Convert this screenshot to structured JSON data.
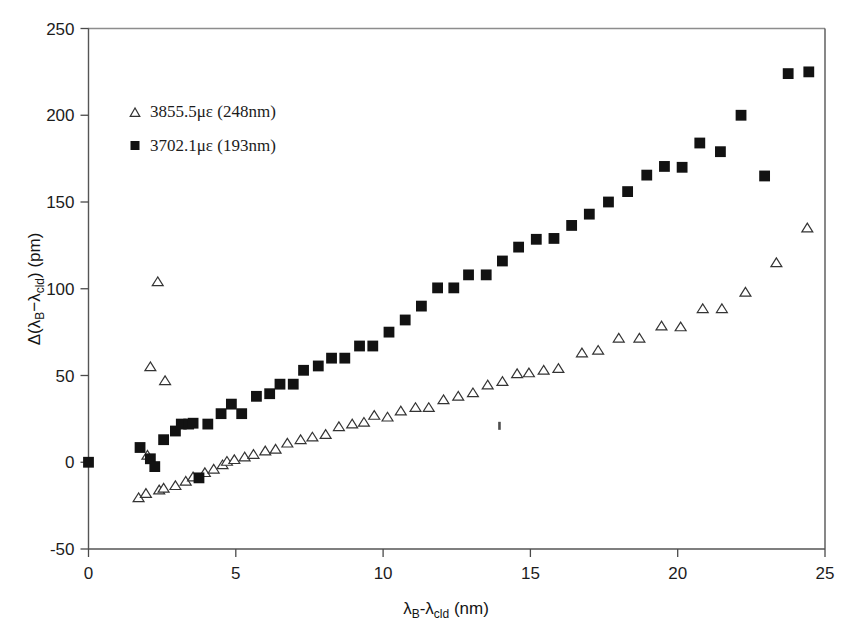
{
  "chart_data": {
    "type": "scatter",
    "title": "",
    "subtitle": "",
    "xlabel": "λB-λcld (nm)",
    "xlabel_parts": {
      "lead": "λ",
      "sub1": "B",
      "mid": "-λ",
      "sub2": "cld",
      "tail": " (nm)"
    },
    "ylabel": "Δ(λB-λcld) (pm)",
    "ylabel_parts": {
      "lead": "Δ(λ",
      "sub1": "B",
      "mid": "−λ",
      "sub2": "cld",
      "tail": ") (pm)"
    },
    "xlim": [
      0,
      25
    ],
    "ylim": [
      -50,
      250
    ],
    "xticks": [
      0,
      5,
      10,
      15,
      20,
      25
    ],
    "yticks": [
      -50,
      0,
      50,
      100,
      150,
      200,
      250
    ],
    "xtick_labels": [
      "0",
      "5",
      "10",
      "15",
      "20",
      "25"
    ],
    "ytick_labels": [
      "-50",
      "0",
      "50",
      "100",
      "150",
      "200",
      "250"
    ],
    "grid": false,
    "legend_position": "upper-left-inside",
    "marker_colors": {
      "series1": "#333333",
      "series2": "#121212"
    },
    "series": [
      {
        "name": "3855.5με (248nm)",
        "label_parts": {
          "value": "3855.5",
          "unit": "με",
          "paren": " (248nm)"
        },
        "marker": "open-triangle",
        "points": [
          [
            1.7,
            -20.5
          ],
          [
            1.95,
            -18.0
          ],
          [
            2.0,
            4.0
          ],
          [
            2.1,
            55.0
          ],
          [
            2.35,
            104.0
          ],
          [
            2.4,
            -16.0
          ],
          [
            2.55,
            -15.0
          ],
          [
            2.6,
            47.0
          ],
          [
            2.95,
            -13.5
          ],
          [
            3.3,
            -11.0
          ],
          [
            3.55,
            -8.5
          ],
          [
            3.95,
            -6.0
          ],
          [
            4.25,
            -4.0
          ],
          [
            4.55,
            -1.5
          ],
          [
            4.7,
            0.5
          ],
          [
            4.95,
            1.5
          ],
          [
            5.3,
            3.0
          ],
          [
            5.6,
            4.5
          ],
          [
            6.0,
            6.5
          ],
          [
            6.35,
            7.5
          ],
          [
            6.75,
            11.0
          ],
          [
            7.2,
            13.0
          ],
          [
            7.6,
            14.5
          ],
          [
            8.05,
            16.0
          ],
          [
            8.5,
            20.5
          ],
          [
            8.95,
            22.0
          ],
          [
            9.35,
            23.0
          ],
          [
            9.7,
            27.0
          ],
          [
            10.15,
            26.0
          ],
          [
            10.6,
            29.5
          ],
          [
            11.1,
            31.5
          ],
          [
            11.55,
            31.5
          ],
          [
            12.05,
            36.0
          ],
          [
            12.55,
            38.0
          ],
          [
            13.05,
            40.0
          ],
          [
            13.55,
            44.5
          ],
          [
            14.05,
            46.5
          ],
          [
            14.55,
            51.0
          ],
          [
            14.95,
            51.5
          ],
          [
            15.45,
            53.0
          ],
          [
            15.95,
            54.0
          ],
          [
            16.75,
            63.0
          ],
          [
            17.3,
            64.5
          ],
          [
            18.0,
            71.5
          ],
          [
            18.7,
            71.5
          ],
          [
            19.45,
            78.5
          ],
          [
            20.1,
            78.0
          ],
          [
            20.85,
            88.5
          ],
          [
            21.5,
            88.5
          ],
          [
            22.3,
            98.0
          ],
          [
            23.35,
            115.0
          ],
          [
            24.4,
            135.0
          ]
        ]
      },
      {
        "name": "3702.1με (193nm)",
        "label_parts": {
          "value": "3702.1",
          "unit": "με",
          "paren": " (193nm)"
        },
        "marker": "filled-square",
        "points": [
          [
            0.0,
            0.0
          ],
          [
            1.75,
            8.5
          ],
          [
            2.1,
            2.0
          ],
          [
            2.25,
            -2.5
          ],
          [
            2.55,
            13.0
          ],
          [
            2.95,
            18.0
          ],
          [
            3.15,
            22.0
          ],
          [
            3.4,
            22.0
          ],
          [
            3.55,
            22.5
          ],
          [
            3.75,
            -9.0
          ],
          [
            4.05,
            22.0
          ],
          [
            4.5,
            28.0
          ],
          [
            4.85,
            33.5
          ],
          [
            5.2,
            28.0
          ],
          [
            5.7,
            38.0
          ],
          [
            6.15,
            39.5
          ],
          [
            6.5,
            45.0
          ],
          [
            6.95,
            45.0
          ],
          [
            7.3,
            53.0
          ],
          [
            7.8,
            55.5
          ],
          [
            8.25,
            60.0
          ],
          [
            8.7,
            60.0
          ],
          [
            9.2,
            67.0
          ],
          [
            9.65,
            67.0
          ],
          [
            10.2,
            75.0
          ],
          [
            10.75,
            82.0
          ],
          [
            11.3,
            90.0
          ],
          [
            11.85,
            100.5
          ],
          [
            12.4,
            100.5
          ],
          [
            12.9,
            108.0
          ],
          [
            13.5,
            108.0
          ],
          [
            14.05,
            116.0
          ],
          [
            14.6,
            124.0
          ],
          [
            15.2,
            128.5
          ],
          [
            15.8,
            129.0
          ],
          [
            16.4,
            136.5
          ],
          [
            17.0,
            143.0
          ],
          [
            17.65,
            150.0
          ],
          [
            18.3,
            156.0
          ],
          [
            18.95,
            165.5
          ],
          [
            19.55,
            170.5
          ],
          [
            20.15,
            170.0
          ],
          [
            20.75,
            184.0
          ],
          [
            21.45,
            179.0
          ],
          [
            22.15,
            200.0
          ],
          [
            22.95,
            165.0
          ],
          [
            23.75,
            224.0
          ],
          [
            24.45,
            225.0
          ]
        ]
      }
    ],
    "artifacts": [
      {
        "name": "scan-speck",
        "x": 13.95,
        "y": 21.0
      }
    ]
  }
}
